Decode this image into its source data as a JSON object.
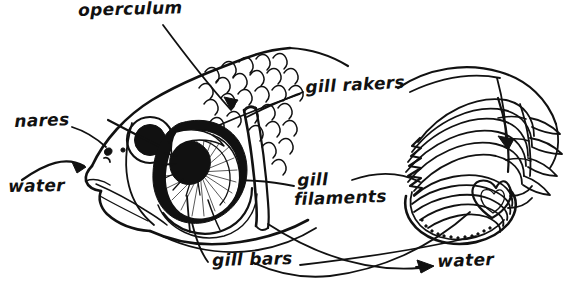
{
  "figure": {
    "style": "hand-drawn black ink line art on white",
    "ink_color": "#111111",
    "background_color": "#ffffff"
  },
  "labels": {
    "operculum": "operculum",
    "nares": "nares",
    "water_left": "water",
    "gill_rakers": "gill rakers",
    "gill_filaments_line1": "gill",
    "gill_filaments_line2": "filaments",
    "gill_bars": "gill bars",
    "water_right": "water"
  },
  "parts": {
    "fish_head": "fish-head",
    "eye": "fish-eye",
    "scales": "body-scales",
    "operculum_flap": "operculum-flap",
    "gill_arch_in_head": "gill-arch-exposed",
    "gill_arch_detail": "gill-arch-closeup",
    "mouth": "fish-mouth"
  },
  "leader_lines": [
    {
      "name": "leader-operculum",
      "from": "operculum",
      "to": "operculum-flap"
    },
    {
      "name": "leader-nares",
      "from": "nares",
      "to": "nostril"
    },
    {
      "name": "leader-water-left",
      "from": "water",
      "to": "mouth-opening"
    },
    {
      "name": "leader-gill-rakers",
      "from": "gill rakers",
      "to": "gill-rakers-structure"
    },
    {
      "name": "leader-gill-rakers-2",
      "from": "gill rakers",
      "to": "gill-arch-closeup"
    },
    {
      "name": "leader-gill-filaments",
      "from": "gill filaments",
      "to": "gill-filaments-structure"
    },
    {
      "name": "leader-gill-bars",
      "from": "gill bars",
      "to": "gill-bar-structure"
    },
    {
      "name": "leader-water-right",
      "from": "water",
      "to": "water-exit-arrow"
    }
  ],
  "arrows": [
    {
      "name": "arrow-water-in",
      "direction": "right",
      "meaning": "water enters mouth"
    },
    {
      "name": "arrow-water-out",
      "direction": "right",
      "meaning": "water exits past gills"
    },
    {
      "name": "arrow-operculum",
      "direction": "down-right",
      "meaning": "points to operculum"
    },
    {
      "name": "arrow-gill-detail",
      "direction": "down",
      "meaning": "points into gill arch detail"
    }
  ]
}
